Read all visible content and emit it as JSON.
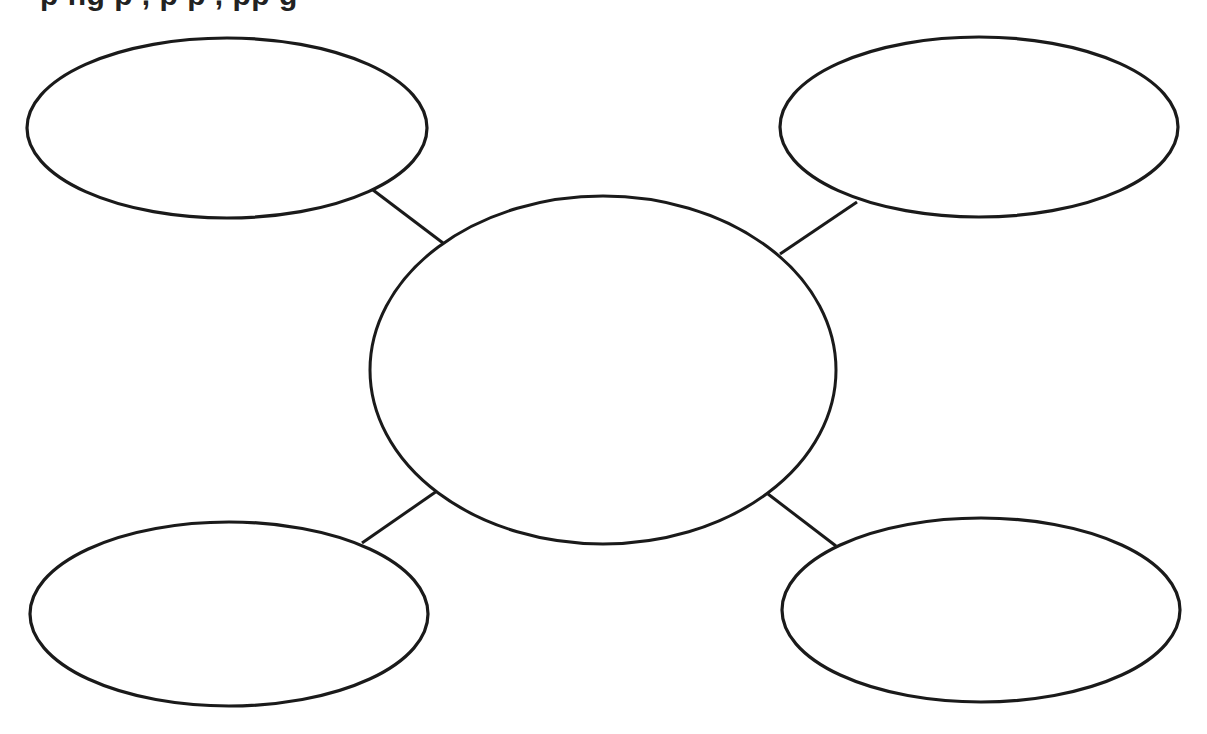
{
  "header": {
    "text": "p                ng p     ,  p   p     ,       pp   g",
    "clipped": true
  },
  "diagram": {
    "type": "bubble-map",
    "stroke_color": "#1a1a1a",
    "fill_color": "#ffffff",
    "center_bubble": {
      "cx": 603,
      "cy": 370,
      "rx": 233,
      "ry": 174,
      "label": ""
    },
    "outer_bubbles": [
      {
        "position": "top-left",
        "cx": 227,
        "cy": 128,
        "rx": 200,
        "ry": 90,
        "label": ""
      },
      {
        "position": "top-right",
        "cx": 979,
        "cy": 127,
        "rx": 199,
        "ry": 90,
        "label": ""
      },
      {
        "position": "bottom-left",
        "cx": 229,
        "cy": 614,
        "rx": 199,
        "ry": 92,
        "label": ""
      },
      {
        "position": "bottom-right",
        "cx": 981,
        "cy": 610,
        "rx": 199,
        "ry": 92,
        "label": ""
      }
    ],
    "connectors": [
      {
        "position": "top-left",
        "x1": 373,
        "y1": 190,
        "x2": 443,
        "y2": 243
      },
      {
        "position": "top-right",
        "x1": 857,
        "y1": 202,
        "x2": 780,
        "y2": 254
      },
      {
        "position": "bottom-left",
        "x1": 362,
        "y1": 543,
        "x2": 437,
        "y2": 491
      },
      {
        "position": "bottom-right",
        "x1": 768,
        "y1": 494,
        "x2": 836,
        "y2": 546
      }
    ]
  }
}
